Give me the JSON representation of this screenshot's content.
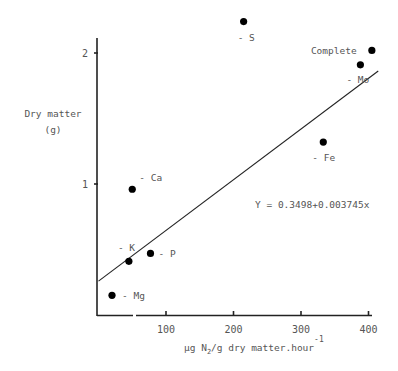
{
  "chart_data": {
    "type": "scatter",
    "title": "",
    "xlabel": "µg N2/g dry matter.hour-1",
    "xlabel_parts": {
      "pre": "µg N",
      "sub": "2",
      "mid": "/g dry matter.hour",
      "sup": "-1"
    },
    "ylabel": "Dry matter (g)",
    "ylabel_lines": [
      "Dry matter",
      "(g)"
    ],
    "xlim": [
      0,
      410
    ],
    "ylim": [
      0,
      2.3
    ],
    "x_ticks": [
      100,
      200,
      300,
      400
    ],
    "y_ticks": [
      1,
      2
    ],
    "grid": false,
    "legend": null,
    "points": [
      {
        "label": "- Mg",
        "x": 20,
        "y": 0.15,
        "label_dx": 10,
        "label_dy": 4
      },
      {
        "label": "- K",
        "x": 45,
        "y": 0.41,
        "label_dx": -11,
        "label_dy": -10
      },
      {
        "label": "- P",
        "x": 77,
        "y": 0.47,
        "label_dx": 8,
        "label_dy": 4
      },
      {
        "label": "- Ca",
        "x": 50,
        "y": 0.96,
        "label_dx": 7,
        "label_dy": -8
      },
      {
        "label": "- S",
        "x": 215,
        "y": 2.24,
        "label_dx": -6,
        "label_dy": 19
      },
      {
        "label": "Complete",
        "x": 405,
        "y": 2.02,
        "label_dx": -61,
        "label_dy": 4
      },
      {
        "label": "- Mo",
        "x": 388,
        "y": 1.91,
        "label_dx": -14,
        "label_dy": 18
      },
      {
        "label": "- Fe",
        "x": 333,
        "y": 1.32,
        "label_dx": -11,
        "label_dy": 19
      }
    ],
    "regression": {
      "equation": "Y = 0.3498+0.003745x",
      "intercept": 0.3498,
      "slope": 0.003745,
      "x_range": [
        0,
        410
      ],
      "equation_pos_x": 255,
      "equation_pos_y": 208
    }
  }
}
